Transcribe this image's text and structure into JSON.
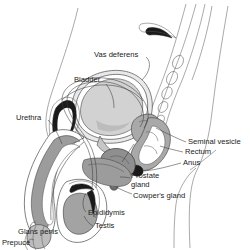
{
  "figure": {
    "background_color": "#ffffff",
    "line_color": "#4a4a4a",
    "label_color": "#1b1b1b"
  },
  "palette": {
    "white": "#ffffff",
    "very_light_gray": "#e9e9e9",
    "light_gray": "#d2d2d2",
    "mid_gray": "#a9a9a9",
    "dark_gray": "#7a7a7a",
    "darker_gray": "#585858",
    "near_black": "#1a1a1a"
  },
  "labels": [
    {
      "id": "vas-deferens",
      "text": "Vas deferens",
      "x": 94,
      "y": 55,
      "anchor": "start"
    },
    {
      "id": "bladder",
      "text": "Bladder",
      "x": 74,
      "y": 80,
      "anchor": "start"
    },
    {
      "id": "urethra",
      "text": "Urethra",
      "x": 16,
      "y": 118,
      "anchor": "start"
    },
    {
      "id": "seminal-vesicle",
      "text": "Seminal vesicle",
      "x": 188,
      "y": 142,
      "anchor": "start"
    },
    {
      "id": "rectum",
      "text": "Rectum",
      "x": 185,
      "y": 152,
      "anchor": "start"
    },
    {
      "id": "anus",
      "text": "Anus",
      "x": 183,
      "y": 163,
      "anchor": "start"
    },
    {
      "id": "prostate-gland-line1",
      "text": "Prostate",
      "x": 131,
      "y": 176,
      "anchor": "start"
    },
    {
      "id": "prostate-gland-line2",
      "text": "gland",
      "x": 131,
      "y": 185,
      "anchor": "start"
    },
    {
      "id": "cowpers-gland",
      "text": "Cowper's gland",
      "x": 133,
      "y": 196,
      "anchor": "start"
    },
    {
      "id": "epididymis",
      "text": "Epididymis",
      "x": 88,
      "y": 213,
      "anchor": "start"
    },
    {
      "id": "testis",
      "text": "Testis",
      "x": 95,
      "y": 226,
      "anchor": "start"
    },
    {
      "id": "glans-penis",
      "text": "Glans penis",
      "x": 18,
      "y": 232,
      "anchor": "start"
    },
    {
      "id": "prepuce",
      "text": "Prepuce",
      "x": 2,
      "y": 243,
      "anchor": "start"
    }
  ],
  "structures": [
    {
      "id": "body-contour",
      "name": "abdominal and leg body contour",
      "fill": "none",
      "stroke": "#555555"
    },
    {
      "id": "bladder-body",
      "name": "urinary bladder",
      "fill": "#d2d2d2",
      "stroke": "#4a4a4a"
    },
    {
      "id": "rectum-body",
      "name": "rectum",
      "fill": "#a9a9a9",
      "stroke": "#4a4a4a"
    },
    {
      "id": "prostate-body",
      "name": "prostate gland",
      "fill": "#8f8f8f",
      "stroke": "#3a3a3a"
    },
    {
      "id": "seminal-vesicle-body",
      "name": "seminal vesicle",
      "fill": "#a9a9a9",
      "stroke": "#4a4a4a"
    },
    {
      "id": "penis-shaft",
      "name": "penis shaft corpus cavernosum",
      "fill": "#9c9c9c",
      "stroke": "#4a4a4a"
    },
    {
      "id": "glans-body",
      "name": "glans penis",
      "fill": "#bdbdbd",
      "stroke": "#4a4a4a"
    },
    {
      "id": "scrotum-outline",
      "name": "scrotum",
      "fill": "#ffffff",
      "stroke": "#4a4a4a"
    },
    {
      "id": "testis-body",
      "name": "testis",
      "fill": "#a3a3a3",
      "stroke": "#4a4a4a"
    },
    {
      "id": "epididymis-body",
      "name": "epididymis",
      "fill": "#1a1a1a",
      "stroke": "#1a1a1a"
    },
    {
      "id": "vas-deferens-tube",
      "name": "vas deferens duct",
      "fill": "none",
      "stroke": "#3a3a3a"
    },
    {
      "id": "sacrum-vertebrae",
      "name": "sacrum and vertebrae",
      "fill": "none",
      "stroke": "#555555"
    },
    {
      "id": "pubic-bone",
      "name": "pubic symphysis bone",
      "fill": "#1a1a1a",
      "stroke": "#1a1a1a"
    },
    {
      "id": "anus-opening",
      "name": "anus",
      "fill": "#1a1a1a",
      "stroke": "#1a1a1a"
    }
  ]
}
